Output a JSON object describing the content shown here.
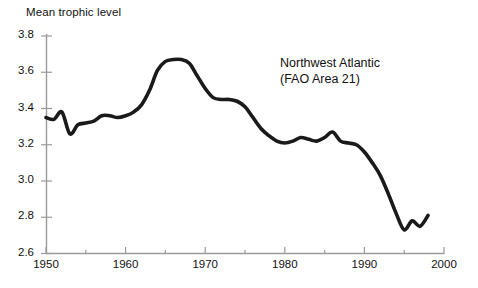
{
  "chart_data": {
    "type": "line",
    "title": "",
    "ylabel": "Mean trophic level",
    "xlabel": "",
    "annotation_line1": "Northwest Atlantic",
    "annotation_line2": "(FAO Area 21)",
    "xlim": [
      1950,
      2000
    ],
    "ylim": [
      2.6,
      3.8
    ],
    "grid": false,
    "legend": "none",
    "line_color": "#1a1a1a",
    "axis_color": "#9a9a9a",
    "text_color": "#111111",
    "yticks": [
      "3.8",
      "3.6",
      "3.4",
      "3.2",
      "3.0",
      "2.8",
      "2.6"
    ],
    "ytick_values": [
      3.8,
      3.6,
      3.4,
      3.2,
      3.0,
      2.8,
      2.6
    ],
    "xticks": [
      "1950",
      "1960",
      "1970",
      "1980",
      "1990",
      "2000"
    ],
    "xtick_values": [
      1950,
      1960,
      1970,
      1980,
      1990,
      2000
    ],
    "xminor_values": [
      1955,
      1965,
      1975,
      1985,
      1995
    ],
    "series": [
      {
        "name": "Mean trophic level",
        "x": [
          1950,
          1951,
          1952,
          1953,
          1954,
          1955,
          1956,
          1957,
          1958,
          1959,
          1960,
          1961,
          1962,
          1963,
          1964,
          1965,
          1966,
          1967,
          1968,
          1969,
          1970,
          1971,
          1972,
          1973,
          1974,
          1975,
          1976,
          1977,
          1978,
          1979,
          1980,
          1981,
          1982,
          1983,
          1984,
          1985,
          1986,
          1987,
          1988,
          1989,
          1990,
          1991,
          1992,
          1993,
          1994,
          1995,
          1996,
          1997,
          1998
        ],
        "values": [
          3.35,
          3.34,
          3.38,
          3.26,
          3.31,
          3.32,
          3.33,
          3.36,
          3.36,
          3.35,
          3.36,
          3.38,
          3.42,
          3.5,
          3.61,
          3.66,
          3.67,
          3.67,
          3.65,
          3.58,
          3.51,
          3.46,
          3.45,
          3.45,
          3.44,
          3.41,
          3.35,
          3.29,
          3.25,
          3.22,
          3.21,
          3.22,
          3.24,
          3.23,
          3.22,
          3.24,
          3.27,
          3.22,
          3.21,
          3.2,
          3.16,
          3.1,
          3.03,
          2.93,
          2.82,
          2.73,
          2.78,
          2.75,
          2.81
        ]
      }
    ]
  }
}
